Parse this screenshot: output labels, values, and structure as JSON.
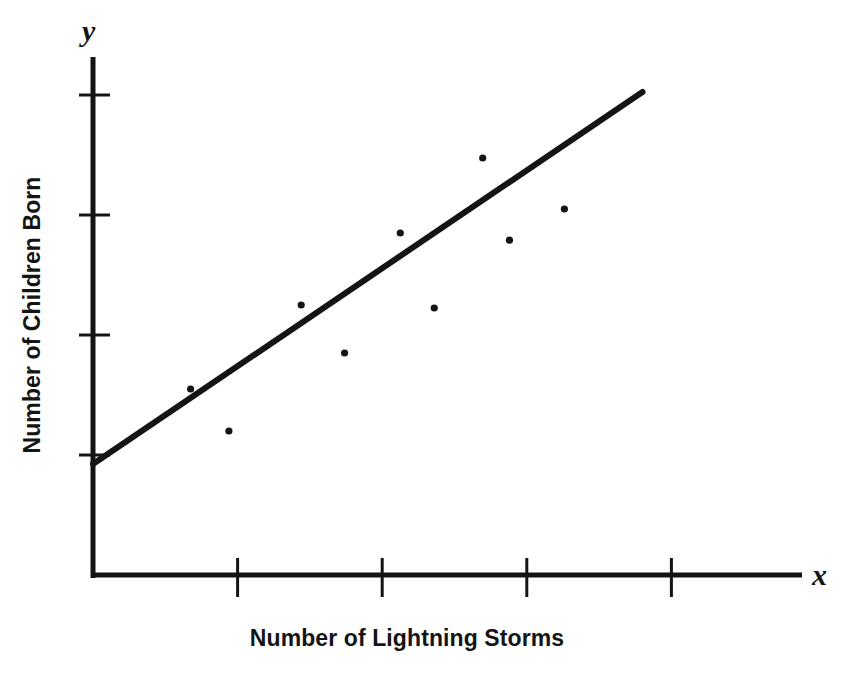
{
  "chart_data": {
    "type": "scatter",
    "title": "",
    "subtitle": "",
    "xlabel": "Number of Lightning Storms",
    "ylabel": "Number of Children Born",
    "x_axis_variable": "x",
    "y_axis_variable": "y",
    "grid": false,
    "legend": "none",
    "xlim": [
      0,
      10
    ],
    "ylim": [
      0,
      10
    ],
    "x_tick_values": [
      2,
      4,
      6,
      8
    ],
    "y_tick_values": [
      2,
      4,
      6,
      8
    ],
    "x_tick_labels": [
      "",
      "",
      "",
      ""
    ],
    "y_tick_labels": [
      "",
      "",
      "",
      ""
    ],
    "axis_color": "#141414",
    "point_color": "#141414",
    "line_color": "#141414",
    "series": [
      {
        "name": "observations",
        "type": "scatter",
        "points": [
          {
            "x": 1.35,
            "y": 3.1
          },
          {
            "x": 1.88,
            "y": 2.4
          },
          {
            "x": 2.88,
            "y": 4.5
          },
          {
            "x": 3.48,
            "y": 3.7
          },
          {
            "x": 4.25,
            "y": 5.7
          },
          {
            "x": 4.72,
            "y": 4.45
          },
          {
            "x": 5.39,
            "y": 6.95
          },
          {
            "x": 5.76,
            "y": 5.58
          },
          {
            "x": 6.52,
            "y": 6.1
          }
        ]
      },
      {
        "name": "trend-line",
        "type": "line",
        "fit": "linear",
        "points": [
          {
            "x": 0.0,
            "y": 1.85
          },
          {
            "x": 7.6,
            "y": 8.05
          }
        ]
      }
    ],
    "annotations": []
  },
  "figure": {
    "x_axis_variable_label": "x",
    "y_axis_variable_label": "y",
    "x_axis_title": "Number of Lightning Storms",
    "y_axis_title": "Number of Children Born"
  }
}
